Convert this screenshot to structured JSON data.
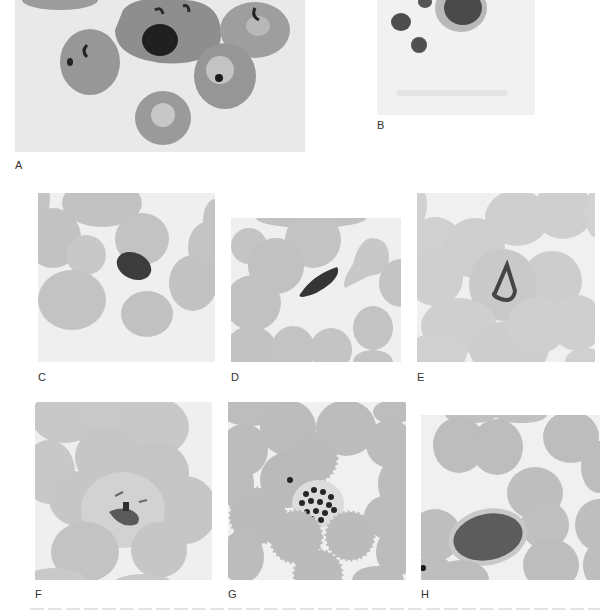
{
  "figure": {
    "panels": [
      {
        "id": "A",
        "label": "A",
        "description": "Several red cells with ring forms and a large dark-staining parasite"
      },
      {
        "id": "B",
        "label": "B",
        "description": "Faded field with small dark parasites"
      },
      {
        "id": "C",
        "label": "C",
        "description": "Dark oval intracellular form among red cells"
      },
      {
        "id": "D",
        "label": "D",
        "description": "Elongated crescent-shaped gametocyte among red cells"
      },
      {
        "id": "E",
        "label": "E",
        "description": "Enlarged red cell with irregular amoeboid trophozoite"
      },
      {
        "id": "F",
        "label": "F",
        "description": "Enlarged stippled red cell with irregular parasite"
      },
      {
        "id": "G",
        "label": "G",
        "description": "Schizont with many merozoites among crenated red cells"
      },
      {
        "id": "H",
        "label": "H",
        "description": "Oval gametocyte filling a red cell"
      }
    ],
    "caption_visible": "clipped"
  },
  "colors": {
    "background": "#ffffff",
    "field": "#ececec",
    "cell": "#b9b9b9",
    "cell_pale": "#cfcfcf",
    "parasite": "#3a3a3a",
    "label_text": "#333333"
  }
}
